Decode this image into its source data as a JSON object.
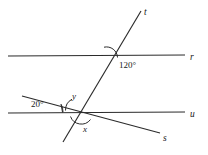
{
  "figure": {
    "background_color": "#ffffff",
    "stroke_color": "#2b2b2b",
    "text_color": "#1a1a1a"
  },
  "lines": [
    {
      "id": "r",
      "label": "r",
      "kind": "horizontal",
      "x1": 8,
      "y1": 56,
      "x2": 185,
      "y2": 55,
      "label_x": 190,
      "label_y": 60
    },
    {
      "id": "u",
      "label": "u",
      "kind": "horizontal",
      "x1": 8,
      "y1": 113,
      "x2": 185,
      "y2": 112,
      "label_x": 190,
      "label_y": 117
    },
    {
      "id": "t",
      "label": "t",
      "kind": "transversal",
      "x1": 63,
      "y1": 142,
      "x2": 141,
      "y2": 11,
      "label_x": 144,
      "label_y": 15
    },
    {
      "id": "s",
      "label": "s",
      "kind": "transversal",
      "x1": 22,
      "y1": 96,
      "x2": 160,
      "y2": 133,
      "label_x": 163,
      "label_y": 141
    }
  ],
  "intersections": [
    {
      "id": "r-t",
      "x": 108,
      "y": 56
    },
    {
      "id": "u-t",
      "x": 77,
      "y": 112
    },
    {
      "id": "u-s",
      "x": 81,
      "y": 113
    }
  ],
  "angles": [
    {
      "id": "angle-120",
      "label": "120°",
      "value": 120,
      "unit": "degrees",
      "at": "r-t",
      "label_x": 119,
      "label_y": 68,
      "arc": "M 117 58 A 10 10 0 0 0 104.2 48.2"
    },
    {
      "id": "angle-y",
      "label": "y",
      "value": null,
      "at": "u-t",
      "label_x": 72,
      "label_y": 99,
      "arc": "M 66 110 A 12 12 0 0 1 71.5 99.6"
    },
    {
      "id": "angle-x",
      "label": "x",
      "value": null,
      "at": "u-s",
      "label_x": 83,
      "label_y": 132,
      "arc": "M 71 116 A 11 11 0 0 0 90 120"
    },
    {
      "id": "angle-20",
      "label": "20°",
      "value": 20,
      "unit": "degrees",
      "at": "u-s",
      "label_x": 31,
      "label_y": 107,
      "arc": "M 62 113 A 18 18 0 0 0 60.2 106.2"
    }
  ],
  "accessibility": {
    "description": "Two parallel horizontal lines r and u are cut by transversal t and by line s. The angle between line t and line r is 120 degrees. Angle y sits above line u on the left of t, angle x sits below line u, and a 20 degree angle is marked between line s and line u."
  }
}
